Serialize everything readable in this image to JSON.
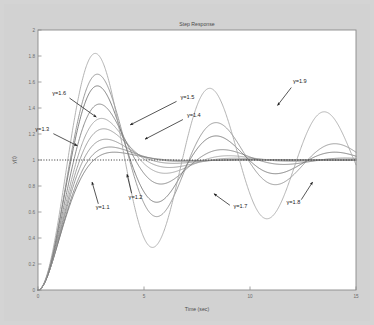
{
  "figure": {
    "background_color": "#d2d2d2",
    "plot_background_color": "#ffffff",
    "axis_color": "#7a7a7a"
  },
  "chart_data": {
    "type": "line",
    "title": "Step Response",
    "xlabel": "Time (sec)",
    "ylabel": "y(t)",
    "xlim": [
      0,
      15
    ],
    "ylim": [
      0,
      2
    ],
    "xticks": [
      "0",
      "5",
      "10",
      "15"
    ],
    "xtick_values": [
      0,
      5,
      10,
      15
    ],
    "yticks": [
      "0",
      "0.2",
      "0.4",
      "0.6",
      "0.8",
      "1",
      "1.2",
      "1.4",
      "1.6",
      "1.8",
      "2"
    ],
    "ytick_values": [
      0,
      0.2,
      0.4,
      0.6,
      0.8,
      1.0,
      1.2,
      1.4,
      1.6,
      1.8,
      2.0
    ],
    "grid": false,
    "legend": "none",
    "reference_line": {
      "y": 1.0,
      "style": "dotted",
      "color": "#2a2a2a"
    },
    "series": [
      {
        "name": "gamma=1.1",
        "gamma": 1.1,
        "color": "#6f6f6f",
        "peak_value": 1.06,
        "peak_time": 3.6,
        "settles_to": 1.0
      },
      {
        "name": "gamma=1.2",
        "gamma": 1.2,
        "color": "#7b7b7b",
        "peak_value": 1.1,
        "peak_time": 3.4,
        "settles_to": 1.0
      },
      {
        "name": "gamma=1.3",
        "gamma": 1.3,
        "color": "#878787",
        "peak_value": 1.16,
        "peak_time": 3.2,
        "settles_to": 1.0
      },
      {
        "name": "gamma=1.4",
        "gamma": 1.4,
        "color": "#8f8f8f",
        "peak_value": 1.24,
        "peak_time": 3.1,
        "settles_to": 1.0
      },
      {
        "name": "gamma=1.5",
        "gamma": 1.5,
        "color": "#9a9a9a",
        "peak_value": 1.32,
        "peak_time": 3.0,
        "settles_to": 1.0
      },
      {
        "name": "gamma=1.6",
        "gamma": 1.6,
        "color": "#777777",
        "peak_value": 1.43,
        "peak_time": 2.9,
        "settles_to": 1.0
      },
      {
        "name": "gamma=1.7",
        "gamma": 1.7,
        "color": "#6a6a6a",
        "peak_value": 1.57,
        "peak_time": 2.8,
        "settles_to": 1.0
      },
      {
        "name": "gamma=1.8",
        "gamma": 1.8,
        "color": "#888888",
        "peak_value": 1.66,
        "peak_time": 2.8,
        "settles_to": 1.0
      },
      {
        "name": "gamma=1.9",
        "gamma": 1.9,
        "color": "#a5a5a5",
        "peak_value": 1.82,
        "peak_time": 2.7,
        "settles_to": 1.0
      }
    ],
    "annotations": [
      {
        "label": "γ=1.1",
        "text_x": 3.05,
        "text_y": 0.62,
        "tip_x": 2.55,
        "tip_y": 0.83
      },
      {
        "label": "γ=1.2",
        "text_x": 4.6,
        "text_y": 0.7,
        "tip_x": 4.2,
        "tip_y": 0.89
      },
      {
        "label": "γ=1.3",
        "text_x": 0.2,
        "text_y": 1.22,
        "tip_x": 1.85,
        "tip_y": 1.11
      },
      {
        "label": "γ=1.4",
        "text_x": 7.35,
        "text_y": 1.33,
        "tip_x": 5.05,
        "tip_y": 1.16
      },
      {
        "label": "γ=1.5",
        "text_x": 7.05,
        "text_y": 1.47,
        "tip_x": 4.35,
        "tip_y": 1.27
      },
      {
        "label": "γ=1.6",
        "text_x": 1.0,
        "text_y": 1.5,
        "tip_x": 2.75,
        "tip_y": 1.33
      },
      {
        "label": "γ=1.7",
        "text_x": 9.55,
        "text_y": 0.63,
        "tip_x": 8.3,
        "tip_y": 0.74
      },
      {
        "label": "γ=1.8",
        "text_x": 12.05,
        "text_y": 0.66,
        "tip_x": 12.95,
        "tip_y": 0.83
      },
      {
        "label": "γ=1.9",
        "text_x": 12.35,
        "text_y": 1.59,
        "tip_x": 11.3,
        "tip_y": 1.42
      }
    ]
  }
}
